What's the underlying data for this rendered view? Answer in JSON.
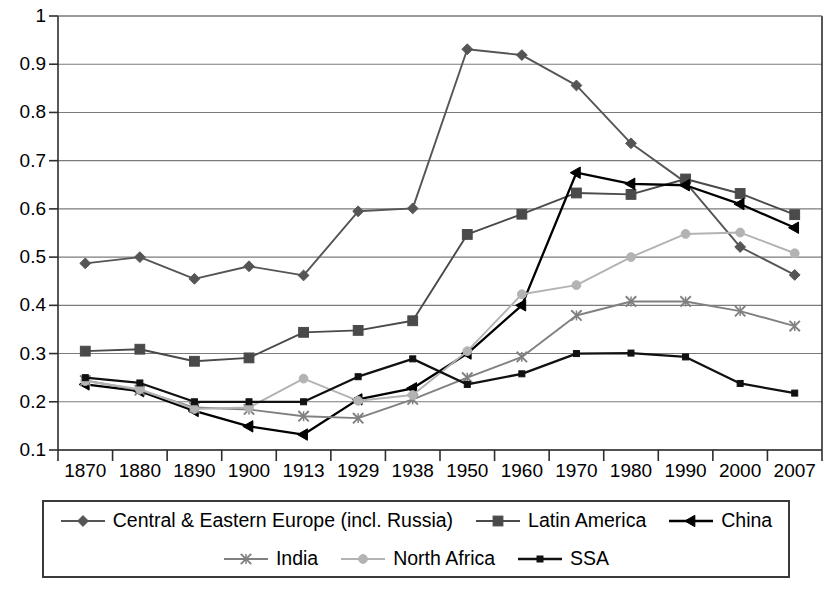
{
  "chart_data": {
    "type": "line",
    "title": "",
    "xlabel": "",
    "ylabel": "",
    "categories": [
      "1870",
      "1880",
      "1890",
      "1900",
      "1913",
      "1929",
      "1938",
      "1950",
      "1960",
      "1970",
      "1980",
      "1990",
      "2000",
      "2007"
    ],
    "ylim": [
      0.1,
      1.0
    ],
    "yticks": [
      "1",
      "0.9",
      "0.8",
      "0.7",
      "0.6",
      "0.5",
      "0.4",
      "0.3",
      "0.2",
      "0.1"
    ],
    "ytick_values": [
      1.0,
      0.9,
      0.8,
      0.7,
      0.6,
      0.5,
      0.4,
      0.3,
      0.2,
      0.1
    ],
    "grid": true,
    "legend_position": "bottom",
    "series": [
      {
        "name": "Central & Eastern Europe (incl. Russia)",
        "marker": "diamond",
        "color": "#555555",
        "values": [
          0.487,
          0.5,
          0.455,
          0.481,
          0.462,
          0.595,
          0.601,
          0.931,
          0.919,
          0.856,
          0.736,
          0.655,
          0.521,
          0.463
        ]
      },
      {
        "name": "Latin America",
        "marker": "square",
        "color": "#4a4a4a",
        "values": [
          0.305,
          0.309,
          0.284,
          0.291,
          0.344,
          0.348,
          0.368,
          0.547,
          0.589,
          0.633,
          0.63,
          0.662,
          0.632,
          0.588
        ]
      },
      {
        "name": "China",
        "marker": "triangle",
        "color": "#000000",
        "values": [
          0.236,
          0.222,
          0.181,
          0.149,
          0.132,
          0.205,
          0.228,
          0.3,
          0.4,
          0.675,
          0.652,
          0.649,
          0.61,
          0.561
        ]
      },
      {
        "name": "India",
        "marker": "cross",
        "color": "#808080",
        "values": [
          0.244,
          0.224,
          0.188,
          0.184,
          0.17,
          0.166,
          0.205,
          0.25,
          0.293,
          0.379,
          0.408,
          0.408,
          0.388,
          0.357
        ]
      },
      {
        "name": "North Africa",
        "marker": "circle-light",
        "color": "#b3b3b3",
        "values": [
          0.243,
          0.226,
          0.185,
          0.188,
          0.248,
          0.202,
          0.214,
          0.305,
          0.423,
          0.442,
          0.5,
          0.548,
          0.551,
          0.508
        ]
      },
      {
        "name": "SSA",
        "marker": "small-square",
        "color": "#111111",
        "values": [
          0.25,
          0.239,
          0.2,
          0.2,
          0.2,
          0.252,
          0.289,
          0.236,
          0.258,
          0.3,
          0.301,
          0.293,
          0.238,
          0.218
        ]
      }
    ]
  },
  "legend": {
    "rows": [
      [
        "Central & Eastern Europe (incl. Russia)",
        "Latin America",
        "China"
      ],
      [
        "India",
        "North Africa",
        "SSA"
      ]
    ]
  }
}
